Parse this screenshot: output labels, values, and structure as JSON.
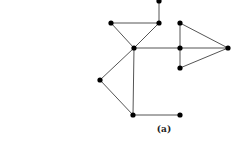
{
  "figure": {
    "caption": "(a)",
    "node_color": "#000000",
    "edge_color": "#555555",
    "nodes": [
      {
        "id": "n1",
        "x": 159,
        "y": 1
      },
      {
        "id": "n2",
        "x": 111,
        "y": 23
      },
      {
        "id": "n3",
        "x": 159,
        "y": 23
      },
      {
        "id": "n4",
        "x": 134,
        "y": 48
      },
      {
        "id": "n5",
        "x": 180,
        "y": 23
      },
      {
        "id": "n6",
        "x": 180,
        "y": 48
      },
      {
        "id": "n7",
        "x": 180,
        "y": 68
      },
      {
        "id": "n8",
        "x": 228,
        "y": 48
      },
      {
        "id": "n9",
        "x": 100,
        "y": 80
      },
      {
        "id": "n10",
        "x": 133,
        "y": 115
      },
      {
        "id": "n11",
        "x": 180,
        "y": 115
      }
    ],
    "edges": [
      [
        "n1",
        "n3"
      ],
      [
        "n2",
        "n3"
      ],
      [
        "n2",
        "n4"
      ],
      [
        "n3",
        "n4"
      ],
      [
        "n4",
        "n6"
      ],
      [
        "n4",
        "n9"
      ],
      [
        "n4",
        "n10"
      ],
      [
        "n9",
        "n10"
      ],
      [
        "n10",
        "n11"
      ],
      [
        "n5",
        "n6"
      ],
      [
        "n6",
        "n7"
      ],
      [
        "n5",
        "n8"
      ],
      [
        "n6",
        "n8"
      ],
      [
        "n7",
        "n8"
      ]
    ]
  }
}
